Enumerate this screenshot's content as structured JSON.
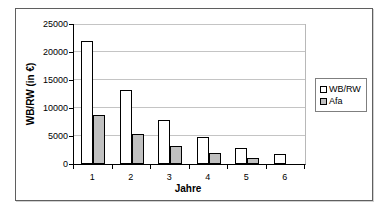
{
  "chart_data": {
    "type": "bar",
    "title": "",
    "categories": [
      "1",
      "2",
      "3",
      "4",
      "5",
      "6"
    ],
    "series": [
      {
        "name": "WB/RW",
        "color": "#ffffff",
        "values": [
          22000,
          13200,
          7920,
          4752,
          2851,
          1711
        ]
      },
      {
        "name": "Afa",
        "color": "#c0c0c0",
        "values": [
          8800,
          5280,
          3168,
          1901,
          1140,
          0
        ]
      }
    ],
    "xlabel": "Jahre",
    "ylabel": "WB/RW (in €)",
    "ylim": [
      0,
      25000
    ],
    "yticks": [
      0,
      5000,
      10000,
      15000,
      20000,
      25000
    ],
    "grid": true,
    "legend_position": "right",
    "bar_border_color": "#000000",
    "gridline_color": "#c4c4c4",
    "plot_background": "#ffffff"
  }
}
